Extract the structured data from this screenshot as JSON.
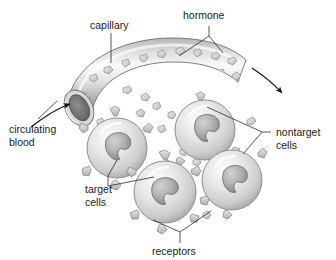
{
  "figure": {
    "background": "#ffffff",
    "width": 336,
    "height": 260
  },
  "colors": {
    "outline": "#555555",
    "leader_line": "#2b2b2b",
    "arrow": "#111111",
    "text": "#1a1a1a",
    "vessel_light": "#f2f2f2",
    "vessel_mid": "#c8c8c8",
    "vessel_dark": "#8e8e8e",
    "lumen_dark": "#6e6e6e",
    "cell_light": "#ededed",
    "cell_mid": "#cfcfcf",
    "cell_edge": "#9a9a9a",
    "nucleus_light": "#c2c2c2",
    "nucleus_dark": "#8a8a8a",
    "hormone_fill": "#d2d2d2",
    "hormone_edge": "#8a8a8a",
    "receptor_fill": "#c9c9c9",
    "receptor_edge": "#7e7e7e"
  },
  "labels": {
    "capillary": "capillary",
    "hormone": "hormone",
    "circulating_blood_line1": "circulating",
    "circulating_blood_line2": "blood",
    "nontarget_line1": "nontarget",
    "nontarget_line2": "cells",
    "target_line1": "target",
    "target_line2": "cells",
    "receptors": "receptors"
  },
  "structures": {
    "capillary": {
      "name": "capillary vessel",
      "shape": "curved tube arc with open elliptical end at lower left",
      "hormone_particle_count": 24
    },
    "cells": [
      {
        "id": "target-cell-left",
        "type": "target",
        "cx": 117,
        "cy": 148,
        "r": 30,
        "receptor_count": 6
      },
      {
        "id": "nontarget-cell-upper-right",
        "type": "nontarget",
        "cx": 205,
        "cy": 130,
        "r": 30,
        "receptor_count": 3
      },
      {
        "id": "target-cell-bottom-center",
        "type": "target",
        "cx": 165,
        "cy": 192,
        "r": 31,
        "receptor_count": 6
      },
      {
        "id": "nontarget-cell-lower-right",
        "type": "nontarget",
        "cx": 232,
        "cy": 180,
        "r": 30,
        "receptor_count": 3
      }
    ],
    "free_hormones": {
      "name": "hormone particles outside vessel",
      "count": 12
    },
    "flow_arrows": [
      {
        "id": "inflow-arrow",
        "description": "curved arrow pointing into capillary lumen"
      },
      {
        "id": "outflow-arrow",
        "description": "curved arrow leaving capillary toward lower right"
      }
    ]
  }
}
